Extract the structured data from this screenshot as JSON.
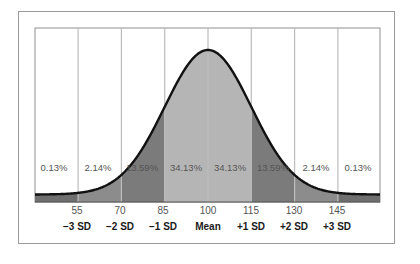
{
  "chart_data": {
    "type": "area",
    "title": "",
    "xlabel": "",
    "ylabel": "",
    "mean": 100,
    "sd": 15,
    "x_ticks": [
      55,
      70,
      85,
      100,
      115,
      130,
      145
    ],
    "sd_labels": [
      "−3 SD",
      "−2 SD",
      "−1 SD",
      "Mean",
      "+1 SD",
      "+2 SD",
      "+3 SD"
    ],
    "bands": [
      {
        "range": "<55",
        "percent": "0.13%",
        "color": "#6f6f6f"
      },
      {
        "range": "55-70",
        "percent": "2.14%",
        "color": "#8c8c8c"
      },
      {
        "range": "70-85",
        "percent": "13.59%",
        "color": "#7b7b7b"
      },
      {
        "range": "85-100",
        "percent": "34.13%",
        "color": "#b5b5b5"
      },
      {
        "range": "100-115",
        "percent": "34.13%",
        "color": "#b5b5b5"
      },
      {
        "range": "115-130",
        "percent": "13.59%",
        "color": "#7b7b7b"
      },
      {
        "range": "130-145",
        "percent": "2.14%",
        "color": "#8c8c8c"
      },
      {
        "range": ">145",
        "percent": "0.13%",
        "color": "#6f6f6f"
      }
    ],
    "grid": true,
    "legend": "none"
  },
  "labels": {
    "pct": [
      "0.13%",
      "2.14%",
      "13.59%",
      "34.13%",
      "34.13%",
      "13.59%",
      "2.14%",
      "0.13%"
    ],
    "ticks": [
      "55",
      "70",
      "85",
      "100",
      "115",
      "130",
      "145"
    ],
    "sd": [
      "−3 SD",
      "−2 SD",
      "−1 SD",
      "Mean",
      "+1 SD",
      "+2 SD",
      "+3 SD"
    ]
  },
  "colors": {
    "curve": "#111111",
    "gridline": "#bdbdbd",
    "frame": "#9a9a9a",
    "tail": "#6f6f6f",
    "band2": "#8c8c8c",
    "band1": "#7b7b7b",
    "center": "#b5b5b5"
  }
}
